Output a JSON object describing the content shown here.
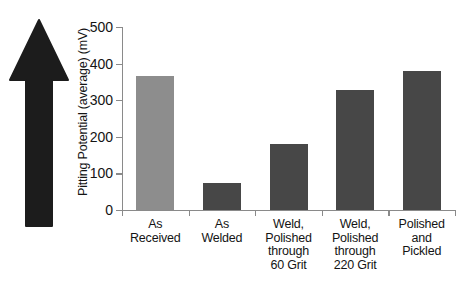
{
  "figure": {
    "arrow_icon": "up-arrow-icon",
    "arrow_color": "#1c1c1c"
  },
  "chart_data": {
    "type": "bar",
    "title": "",
    "xlabel": "",
    "ylabel": "Pitting Potential (average) (mV)",
    "categories": [
      "As Received",
      "As Welded",
      "Weld, Polished through 60 Grit",
      "Weld, Polished through 220 Grit",
      "Polished and Pickled"
    ],
    "category_lines": [
      [
        "As",
        "Received"
      ],
      [
        "As",
        "Welded"
      ],
      [
        "Weld,",
        "Polished",
        "through",
        "60 Grit"
      ],
      [
        "Weld,",
        "Polished",
        "through",
        "220 Grit"
      ],
      [
        "Polished",
        "and",
        "Pickled"
      ]
    ],
    "values": [
      365,
      75,
      180,
      328,
      380
    ],
    "bar_colors": [
      "#8d8d8d",
      "#474747",
      "#474747",
      "#474747",
      "#474747"
    ],
    "ylim": [
      0,
      500
    ],
    "yticks": [
      0,
      100,
      200,
      300,
      400,
      500
    ],
    "ytick_labels": [
      "0",
      "100",
      "200",
      "300",
      "400",
      "500"
    ],
    "grid": false,
    "legend": "none"
  }
}
